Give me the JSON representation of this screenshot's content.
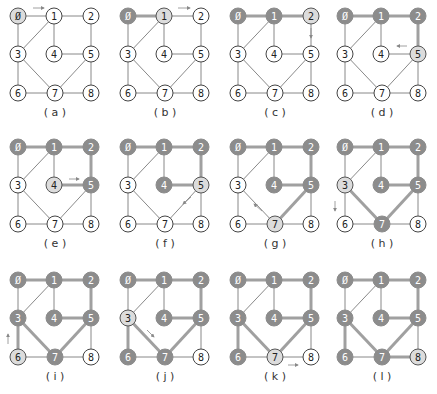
{
  "figure": {
    "nodes": [
      {
        "id": "0",
        "x": 18,
        "y": 16
      },
      {
        "id": "1",
        "x": 54,
        "y": 16
      },
      {
        "id": "2",
        "x": 91,
        "y": 16
      },
      {
        "id": "3",
        "x": 18,
        "y": 54
      },
      {
        "id": "4",
        "x": 54,
        "y": 54
      },
      {
        "id": "5",
        "x": 91,
        "y": 54
      },
      {
        "id": "6",
        "x": 18,
        "y": 93
      },
      {
        "id": "7",
        "x": 55,
        "y": 93
      },
      {
        "id": "8",
        "x": 91,
        "y": 93
      }
    ],
    "edges": [
      [
        "0",
        "1"
      ],
      [
        "1",
        "2"
      ],
      [
        "0",
        "3"
      ],
      [
        "1",
        "3"
      ],
      [
        "1",
        "4"
      ],
      [
        "2",
        "5"
      ],
      [
        "4",
        "5"
      ],
      [
        "3",
        "6"
      ],
      [
        "3",
        "7"
      ],
      [
        "5",
        "7"
      ],
      [
        "5",
        "8"
      ],
      [
        "6",
        "7"
      ],
      [
        "7",
        "8"
      ]
    ],
    "colors": {
      "visited_fill": "#8c8c8c",
      "visited_text": "#ffffff",
      "current_fill": "#dcdcdc",
      "current_stroke": "#555555",
      "unvisited_fill": "#ffffff",
      "unvisited_stroke": "#444444",
      "edge": "#6a6a6a",
      "tree_edge": "#a0a0a0",
      "arrow": "#888888"
    },
    "panels": [
      {
        "label": "(a)",
        "ox": 0,
        "oy": 0,
        "current": "0",
        "visited": [],
        "tree": [],
        "arrow": {
          "from": [
            33,
            8
          ],
          "to": [
            44,
            8
          ]
        }
      },
      {
        "label": "(b)",
        "ox": 110,
        "oy": 0,
        "current": "1",
        "visited": [
          "0"
        ],
        "tree": [
          [
            "0",
            "1"
          ]
        ],
        "arrow": {
          "from": [
            68,
            8
          ],
          "to": [
            80,
            8
          ]
        }
      },
      {
        "label": "(c)",
        "ox": 220,
        "oy": 0,
        "current": "2",
        "visited": [
          "0",
          "1"
        ],
        "tree": [
          [
            "0",
            "1"
          ],
          [
            "1",
            "2"
          ]
        ],
        "arrow": {
          "from": [
            91,
            28
          ],
          "to": [
            91,
            38
          ]
        }
      },
      {
        "label": "(d)",
        "ox": 327,
        "oy": 0,
        "current": "5",
        "visited": [
          "0",
          "1",
          "2"
        ],
        "tree": [
          [
            "0",
            "1"
          ],
          [
            "1",
            "2"
          ],
          [
            "2",
            "5"
          ]
        ],
        "arrow": {
          "from": [
            80,
            46
          ],
          "to": [
            70,
            46
          ]
        }
      },
      {
        "label": "(e)",
        "ox": 0,
        "oy": 131,
        "current": "4",
        "visited": [
          "0",
          "1",
          "2",
          "5"
        ],
        "tree": [
          [
            "0",
            "1"
          ],
          [
            "1",
            "2"
          ],
          [
            "2",
            "5"
          ],
          [
            "4",
            "5"
          ]
        ],
        "arrow": {
          "from": [
            69,
            48
          ],
          "to": [
            79,
            48
          ]
        }
      },
      {
        "label": "(f)",
        "ox": 110,
        "oy": 131,
        "current": "5",
        "visited": [
          "0",
          "1",
          "2",
          "4"
        ],
        "tree": [
          [
            "0",
            "1"
          ],
          [
            "1",
            "2"
          ],
          [
            "2",
            "5"
          ],
          [
            "4",
            "5"
          ]
        ],
        "arrow": {
          "from": [
            81,
            66
          ],
          "to": [
            73,
            73
          ]
        }
      },
      {
        "label": "(g)",
        "ox": 220,
        "oy": 131,
        "current": "7",
        "visited": [
          "0",
          "1",
          "2",
          "4",
          "5"
        ],
        "tree": [
          [
            "0",
            "1"
          ],
          [
            "1",
            "2"
          ],
          [
            "2",
            "5"
          ],
          [
            "4",
            "5"
          ],
          [
            "5",
            "7"
          ]
        ],
        "arrow": {
          "from": [
            42,
            80
          ],
          "to": [
            34,
            73
          ]
        }
      },
      {
        "label": "(h)",
        "ox": 327,
        "oy": 131,
        "current": "3",
        "visited": [
          "0",
          "1",
          "2",
          "4",
          "5",
          "7"
        ],
        "tree": [
          [
            "0",
            "1"
          ],
          [
            "1",
            "2"
          ],
          [
            "2",
            "5"
          ],
          [
            "4",
            "5"
          ],
          [
            "5",
            "7"
          ],
          [
            "3",
            "7"
          ]
        ],
        "arrow": {
          "from": [
            8,
            70
          ],
          "to": [
            8,
            80
          ]
        }
      },
      {
        "label": "(i)",
        "ox": 0,
        "oy": 264,
        "current": "6",
        "visited": [
          "0",
          "1",
          "2",
          "3",
          "4",
          "5",
          "7"
        ],
        "tree": [
          [
            "0",
            "1"
          ],
          [
            "1",
            "2"
          ],
          [
            "2",
            "5"
          ],
          [
            "4",
            "5"
          ],
          [
            "5",
            "7"
          ],
          [
            "3",
            "7"
          ],
          [
            "3",
            "6"
          ]
        ],
        "arrow": {
          "from": [
            8,
            80
          ],
          "to": [
            8,
            70
          ]
        }
      },
      {
        "label": "(j)",
        "ox": 110,
        "oy": 264,
        "current": "3",
        "visited": [
          "0",
          "1",
          "2",
          "4",
          "5",
          "6",
          "7"
        ],
        "tree": [
          [
            "0",
            "1"
          ],
          [
            "1",
            "2"
          ],
          [
            "2",
            "5"
          ],
          [
            "4",
            "5"
          ],
          [
            "5",
            "7"
          ],
          [
            "3",
            "7"
          ],
          [
            "3",
            "6"
          ]
        ],
        "arrow": {
          "from": [
            37,
            66
          ],
          "to": [
            44,
            73
          ]
        }
      },
      {
        "label": "(k)",
        "ox": 220,
        "oy": 264,
        "current": "7",
        "visited": [
          "0",
          "1",
          "2",
          "3",
          "4",
          "5",
          "6"
        ],
        "tree": [
          [
            "0",
            "1"
          ],
          [
            "1",
            "2"
          ],
          [
            "2",
            "5"
          ],
          [
            "4",
            "5"
          ],
          [
            "5",
            "7"
          ],
          [
            "3",
            "7"
          ],
          [
            "3",
            "6"
          ]
        ],
        "arrow": {
          "from": [
            68,
            101
          ],
          "to": [
            78,
            101
          ]
        }
      },
      {
        "label": "(l)",
        "ox": 327,
        "oy": 264,
        "current": "8",
        "visited": [
          "0",
          "1",
          "2",
          "3",
          "4",
          "5",
          "6",
          "7"
        ],
        "tree": [
          [
            "0",
            "1"
          ],
          [
            "1",
            "2"
          ],
          [
            "2",
            "5"
          ],
          [
            "4",
            "5"
          ],
          [
            "5",
            "7"
          ],
          [
            "3",
            "7"
          ],
          [
            "3",
            "6"
          ],
          [
            "7",
            "8"
          ]
        ],
        "arrow": null
      }
    ]
  }
}
